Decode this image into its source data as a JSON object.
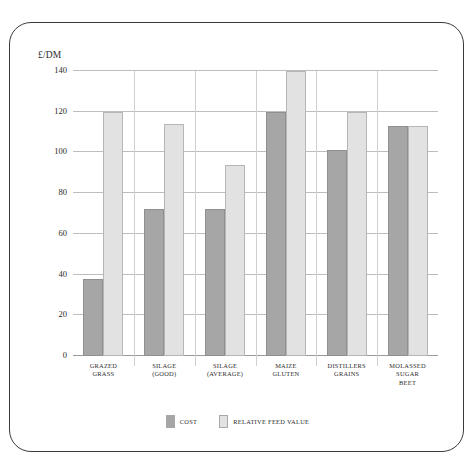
{
  "caption_strip": {
    "text": ""
  },
  "figure": {
    "frame_style": "rounded-border",
    "border_color": "#3a3a3a",
    "background": "#ffffff"
  },
  "legend": {
    "position": "bottom-center",
    "entries": [
      {
        "label": "COST",
        "color": "#a6a6a6",
        "swatch_name": "legend-swatch-cost"
      },
      {
        "label": "RELATIVE FEED VALUE",
        "color": "#e2e2e2",
        "swatch_name": "legend-swatch-rfv"
      }
    ]
  },
  "chart_data": {
    "type": "bar",
    "title": "",
    "subtitle": "",
    "xlabel": "",
    "ylabel": "£/DM",
    "ylim": [
      0,
      140
    ],
    "yticks": [
      0,
      20,
      40,
      60,
      80,
      100,
      120,
      140
    ],
    "ytick_labels": [
      "0",
      "20",
      "40",
      "60",
      "80",
      "100",
      "120",
      "140"
    ],
    "grid": true,
    "grid_axis": "y",
    "legend_position": "bottom-center",
    "categories": [
      "GRAZED GRASS",
      "SILAGE (GOOD)",
      "SILAGE (AVERAGE)",
      "MAIZE GLUTEN",
      "DISTILLERS GRAINS",
      "MOLASSED SUGAR BEET"
    ],
    "category_lines": [
      [
        "GRAZED",
        "GRASS"
      ],
      [
        "SILAGE",
        "(GOOD)"
      ],
      [
        "SILAGE",
        "(AVERAGE)"
      ],
      [
        "MAIZE",
        "GLUTEN"
      ],
      [
        "DISTILLERS",
        "GRAINS"
      ],
      [
        "MOLASSED",
        "SUGAR",
        "BEET"
      ]
    ],
    "series": [
      {
        "name": "COST",
        "color": "#a6a6a6",
        "values": [
          38,
          72,
          72,
          120,
          101,
          113
        ]
      },
      {
        "name": "RELATIVE FEED VALUE",
        "color": "#e2e2e2",
        "values": [
          120,
          114,
          94,
          140,
          120,
          113
        ]
      }
    ]
  }
}
